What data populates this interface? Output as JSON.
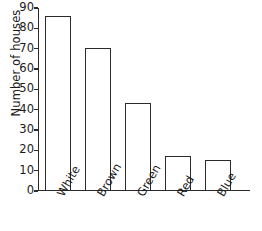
{
  "chart_data": {
    "type": "bar",
    "title": "",
    "xlabel": "",
    "ylabel": "Number of houses",
    "categories": [
      "White",
      "Brown",
      "Green",
      "Red",
      "Blue"
    ],
    "values": [
      86,
      70,
      43,
      17,
      15
    ],
    "ylim": [
      0,
      90
    ],
    "ytick_labels": [
      "0",
      "10",
      "20",
      "30",
      "40",
      "50",
      "60",
      "70",
      "80",
      "90"
    ],
    "ytick_values": [
      0,
      10,
      20,
      30,
      40,
      50,
      60,
      70,
      80,
      90
    ],
    "grid": false,
    "legend": null,
    "series": [
      {
        "name": "Number of houses",
        "values": [
          86,
          70,
          43,
          17,
          15
        ]
      }
    ],
    "colors": {
      "bar_fill": "#ffffff",
      "bar_outline": "#2b2b2b",
      "axis": "#2b2b2b",
      "text": "#1a1a1a",
      "background": "#ffffff"
    }
  }
}
